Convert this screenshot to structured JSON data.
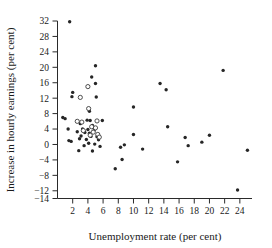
{
  "chart_data": {
    "type": "scatter",
    "title": "",
    "xlabel": "Unemployment rate (per cent)",
    "ylabel": "Increase in hourly earnings (per cent)",
    "xlim": [
      0,
      25.6
    ],
    "ylim": [
      -14,
      32
    ],
    "xticks": [
      2,
      4,
      6,
      8,
      10,
      12,
      14,
      16,
      18,
      20,
      22,
      24
    ],
    "yticks": [
      32,
      28,
      24,
      20,
      16,
      12,
      8,
      4,
      0,
      -4,
      -8,
      -12,
      -14
    ],
    "grid": false,
    "legend": null,
    "series": [
      {
        "name": "filled",
        "marker": "filled-circle",
        "color": "#262626",
        "points": [
          [
            1.6,
            31.8
          ],
          [
            5.0,
            20.4
          ],
          [
            21.8,
            19.2
          ],
          [
            4.5,
            17.5
          ],
          [
            5.0,
            15.8
          ],
          [
            13.5,
            15.8
          ],
          [
            14.3,
            14.2
          ],
          [
            2.0,
            13.5
          ],
          [
            1.9,
            12.4
          ],
          [
            5.1,
            12.3
          ],
          [
            10.0,
            9.7
          ],
          [
            4.2,
            8.6
          ],
          [
            0.7,
            7.0
          ],
          [
            1.0,
            6.7
          ],
          [
            3.9,
            6.3
          ],
          [
            4.3,
            6.2
          ],
          [
            5.9,
            6.2
          ],
          [
            3.0,
            5.4
          ],
          [
            4.6,
            4.9
          ],
          [
            14.5,
            4.6
          ],
          [
            1.4,
            4.0
          ],
          [
            3.3,
            4.0
          ],
          [
            4.0,
            3.9
          ],
          [
            4.8,
            3.6
          ],
          [
            2.6,
            3.3
          ],
          [
            3.6,
            3.1
          ],
          [
            4.2,
            2.9
          ],
          [
            10.0,
            2.6
          ],
          [
            20.0,
            2.4
          ],
          [
            3.1,
            2.2
          ],
          [
            4.4,
            2.1
          ],
          [
            5.2,
            2.0
          ],
          [
            16.8,
            1.8
          ],
          [
            2.9,
            1.5
          ],
          [
            3.8,
            1.3
          ],
          [
            5.4,
            1.2
          ],
          [
            1.5,
            1.0
          ],
          [
            1.8,
            0.8
          ],
          [
            19.0,
            0.6
          ],
          [
            4.1,
            0.3
          ],
          [
            4.9,
            0.1
          ],
          [
            8.8,
            -0.1
          ],
          [
            3.5,
            -0.3
          ],
          [
            17.2,
            -0.3
          ],
          [
            5.6,
            -0.5
          ],
          [
            8.3,
            -0.7
          ],
          [
            11.2,
            -1.2
          ],
          [
            25.0,
            -1.5
          ],
          [
            2.8,
            -1.6
          ],
          [
            4.6,
            -1.7
          ],
          [
            8.5,
            -3.9
          ],
          [
            15.8,
            -4.5
          ],
          [
            7.6,
            -6.3
          ],
          [
            23.7,
            -11.8
          ]
        ]
      },
      {
        "name": "open",
        "marker": "open-circle",
        "color": "#ffffff",
        "points": [
          [
            4.0,
            15.0
          ],
          [
            3.0,
            12.2
          ],
          [
            4.1,
            9.3
          ],
          [
            2.6,
            6.0
          ],
          [
            3.2,
            5.8
          ],
          [
            5.2,
            6.1
          ],
          [
            4.5,
            4.6
          ],
          [
            5.0,
            4.3
          ],
          [
            3.4,
            3.6
          ],
          [
            4.7,
            3.2
          ],
          [
            5.3,
            2.6
          ],
          [
            4.3,
            2.4
          ],
          [
            5.5,
            1.9
          ]
        ]
      }
    ]
  }
}
